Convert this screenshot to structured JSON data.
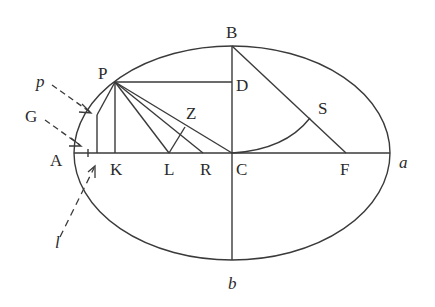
{
  "diagram": {
    "type": "ellipse-geometry",
    "colors": {
      "stroke": "#3a3a3a",
      "text": "#2a2a2a",
      "background": "#ffffff"
    },
    "points": {
      "A": "A",
      "B": "B",
      "C": "C",
      "D": "D",
      "F": "F",
      "G": "G",
      "K": "K",
      "L": "L",
      "P": "P",
      "R": "R",
      "S": "S",
      "Z": "Z",
      "p": "p",
      "l": "l",
      "a": "a",
      "b": "b"
    }
  }
}
